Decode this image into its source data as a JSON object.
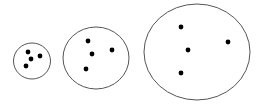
{
  "diagram": {
    "background": "#ffffff",
    "stroke_color": "#555555",
    "dot_color": "#000000",
    "clusters": [
      {
        "name": "small-cluster",
        "ellipse": {
          "cx": 32,
          "cy": 61,
          "rx": 18.5,
          "ry": 18
        },
        "dots": [
          {
            "x": 28,
            "y": 52
          },
          {
            "x": 31,
            "y": 59
          },
          {
            "x": 40,
            "y": 56
          },
          {
            "x": 26,
            "y": 66
          }
        ]
      },
      {
        "name": "medium-cluster",
        "ellipse": {
          "cx": 96,
          "cy": 58,
          "rx": 33,
          "ry": 31
        },
        "dots": [
          {
            "x": 88,
            "y": 41
          },
          {
            "x": 92,
            "y": 54
          },
          {
            "x": 112,
            "y": 50
          },
          {
            "x": 86,
            "y": 69
          }
        ]
      },
      {
        "name": "large-cluster",
        "ellipse": {
          "cx": 197,
          "cy": 52,
          "rx": 53,
          "ry": 48
        },
        "dots": [
          {
            "x": 181,
            "y": 27
          },
          {
            "x": 188,
            "y": 50
          },
          {
            "x": 228,
            "y": 42
          },
          {
            "x": 181,
            "y": 73
          }
        ]
      }
    ]
  }
}
